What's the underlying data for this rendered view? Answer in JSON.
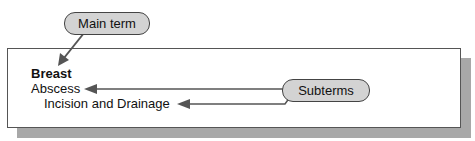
{
  "callouts": {
    "main_term": "Main term",
    "subterms": "Subterms"
  },
  "index_entry": {
    "main_term": "Breast",
    "subterm_1": "Abscess",
    "subterm_2": "Incision and Drainage"
  },
  "colors": {
    "pill_fill": "#d3d3d3",
    "arrow": "#555555",
    "shadow": "#a8a8a8"
  }
}
